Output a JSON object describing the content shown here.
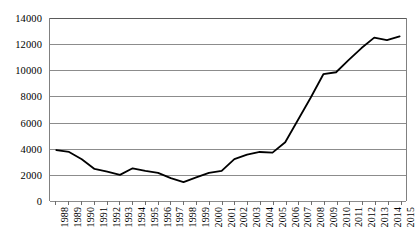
{
  "chart_data": {
    "type": "line",
    "title": "",
    "subtitle": "",
    "xlabel": "",
    "ylabel": "",
    "legend": [],
    "legend_position": "none",
    "grid": true,
    "xlim": [
      "1988",
      "2015"
    ],
    "ylim": [
      0,
      14000
    ],
    "y_ticks": [
      0,
      2000,
      4000,
      6000,
      8000,
      10000,
      12000,
      14000
    ],
    "y_tick_labels": [
      "0",
      "2000",
      "4000",
      "6000",
      "8000",
      "10000",
      "12000",
      "14000"
    ],
    "categories": [
      "1988",
      "1989",
      "1990",
      "1991",
      "1992",
      "1993",
      "1994",
      "1995",
      "1996",
      "1997",
      "1998",
      "1999",
      "2000",
      "2001",
      "2002",
      "2003",
      "2004",
      "2005",
      "2006",
      "2007",
      "2008",
      "2009",
      "2010",
      "2011",
      "2012",
      "2013",
      "2014",
      "2015"
    ],
    "values": [
      3900,
      3750,
      3200,
      2450,
      2250,
      2000,
      2500,
      2300,
      2150,
      1750,
      1450,
      1800,
      2150,
      2300,
      3200,
      3550,
      3750,
      3700,
      4500,
      6200,
      7900,
      9700,
      9850,
      10800,
      11700,
      12500,
      12300,
      12600
    ],
    "series": [
      {
        "name": "series-1",
        "color": "#000000",
        "line_width": 1.8,
        "values": [
          3900,
          3750,
          3200,
          2450,
          2250,
          2000,
          2500,
          2300,
          2150,
          1750,
          1450,
          1800,
          2150,
          2300,
          3200,
          3550,
          3750,
          3700,
          4500,
          6200,
          7900,
          9700,
          9850,
          10800,
          11700,
          12500,
          12300,
          12600
        ]
      }
    ]
  },
  "colors": {
    "line": "#000000",
    "grid": "#8c8c8c",
    "axis": "#808080",
    "background": "#ffffff",
    "text": "#000000"
  }
}
